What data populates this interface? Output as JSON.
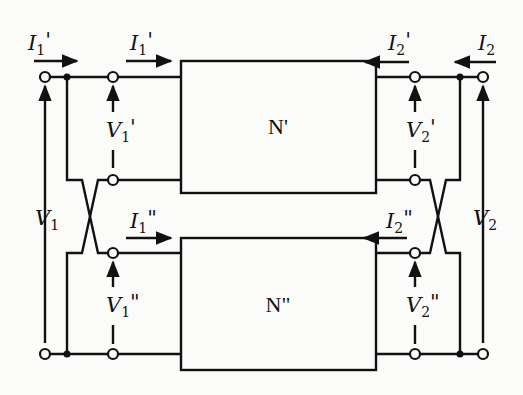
{
  "diagram": {
    "type": "two-port series-parallel interconnection",
    "networks": {
      "top": {
        "label": "N'"
      },
      "bottom": {
        "label": "N\""
      }
    },
    "currents": {
      "I1_outer": {
        "symbol": "I",
        "sub": "1",
        "prime": "'"
      },
      "I1_top": {
        "symbol": "I",
        "sub": "1",
        "prime": "'"
      },
      "I1_bottom": {
        "symbol": "I",
        "sub": "1",
        "prime": "\""
      },
      "I2_outer": {
        "symbol": "I",
        "sub": "2",
        "prime": ""
      },
      "I2_top": {
        "symbol": "I",
        "sub": "2",
        "prime": "'"
      },
      "I2_bottom": {
        "symbol": "I",
        "sub": "2",
        "prime": "\""
      }
    },
    "voltages": {
      "V1": {
        "symbol": "V",
        "sub": "1",
        "prime": ""
      },
      "V1_top": {
        "symbol": "V",
        "sub": "1",
        "prime": "'"
      },
      "V1_bottom": {
        "symbol": "V",
        "sub": "1",
        "prime": "\""
      },
      "V2": {
        "symbol": "V",
        "sub": "2",
        "prime": ""
      },
      "V2_top": {
        "symbol": "V",
        "sub": "2",
        "prime": "'"
      },
      "V2_bottom": {
        "symbol": "V",
        "sub": "2",
        "prime": "\""
      }
    },
    "colors": {
      "ink": "#111111",
      "paper": "#fbfbf9"
    }
  }
}
